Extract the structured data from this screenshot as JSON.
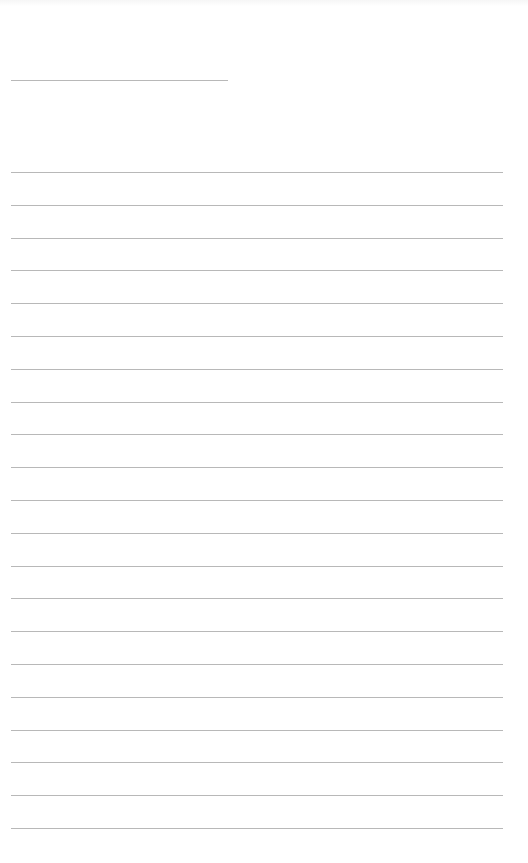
{
  "page": {
    "type": "blank-lined-sheet",
    "background_color": "#ffffff",
    "line_color": "#b8b8b8"
  },
  "header_line": {
    "x_start": 11,
    "x_end": 228,
    "y": 80
  },
  "ruled_lines": {
    "x_start": 11,
    "x_end": 503,
    "first_y": 172,
    "spacing": 32.8,
    "count": 21
  }
}
